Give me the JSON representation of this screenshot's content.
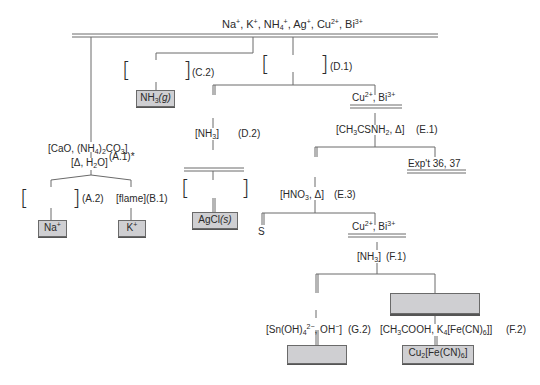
{
  "diagram": {
    "top_ions": {
      "parts": [
        "Na",
        "+",
        ", K",
        "+",
        ", NH",
        "4",
        "+",
        ", Ag",
        "+",
        ", Cu",
        "2+",
        ", Bi",
        "3+"
      ]
    },
    "branch_C": {
      "step": "(C.2)",
      "product": "NH",
      "product_sub": "3",
      "product_state": "(g)"
    },
    "branch_D": {
      "step_1": "(D.1)",
      "reagent_2": "[NH",
      "reagent_2_sub": "3",
      "reagent_2_close": "]",
      "step_2": "(D.2)",
      "product": "AgCl",
      "product_state": "(s)"
    },
    "branch_A": {
      "reagent_1": "[CaO, (NH",
      "reagent_1_sub1": "4",
      "reagent_1_mid": ")",
      "reagent_1_sub2": "2",
      "reagent_1_end": "CO",
      "reagent_1_sub3": "3",
      "reagent_1_close": "]",
      "reagent_2": "[Δ, H",
      "reagent_2_sub": "2",
      "reagent_2_close": "O]",
      "step_1": "(A.1)*",
      "step_2": "(A.2)",
      "product_na": "Na",
      "product_na_sup": "+"
    },
    "branch_B": {
      "reagent": "[flame]",
      "step": "(B.1)",
      "product_k": "K",
      "product_k_sup": "+"
    },
    "branch_E": {
      "ions": "Cu",
      "ions_sup1": "2+",
      "ions_mid": ", Bi",
      "ions_sup2": "3+",
      "reagent_1": "[CH",
      "reagent_1_sub1": "3",
      "reagent_1_mid": "CSNH",
      "reagent_1_sub2": "2",
      "reagent_1_close": ", Δ]",
      "step_1": "(E.1)",
      "exp_ref": "Exp't 36, 37",
      "reagent_3": "[HNO",
      "reagent_3_sub": "3",
      "reagent_3_close": ", Δ]",
      "step_3": "(E.3)",
      "product_s": "S"
    },
    "branch_F": {
      "ions": "Cu",
      "ions_sup1": "2+",
      "ions_mid": ", Bi",
      "ions_sup2": "3+",
      "reagent_1": "[NH",
      "reagent_1_sub": "3",
      "reagent_1_close": "]",
      "step_1": "(F.1)",
      "reagent_2": "[CH",
      "reagent_2_sub1": "3",
      "reagent_2_mid": "COOH, K",
      "reagent_2_sub2": "4",
      "reagent_2_close": "[Fe(CN)",
      "reagent_2_sub3": "6",
      "reagent_2_end": "]]",
      "step_2": "(F.2)",
      "product": "Cu",
      "product_sub1": "2",
      "product_mid": "[Fe(CN)",
      "product_sub2": "6",
      "product_end": "]"
    },
    "branch_G": {
      "reagent": "[Sn(OH)",
      "reagent_sub": "4",
      "reagent_sup": "2−",
      "reagent_mid": ", OH",
      "reagent_sup2": "−",
      "reagent_close": "]",
      "step": "(G.2)"
    },
    "colors": {
      "line": "#6a6a6a",
      "box_fill": "#cfcfd2",
      "text": "#2a2a2a"
    }
  }
}
